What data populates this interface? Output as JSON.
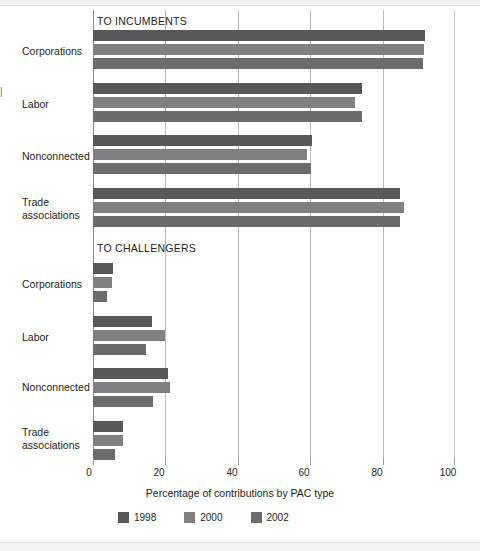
{
  "chart_data": {
    "type": "bar",
    "orientation": "horizontal",
    "title": "",
    "xlabel": "Percentage of contributions by PAC type",
    "ylabel": "",
    "xlim": [
      0,
      100
    ],
    "xticks": [
      0,
      20,
      40,
      60,
      80,
      100
    ],
    "xtick_labels": [
      "0",
      "20",
      "40",
      "60",
      "80",
      "100"
    ],
    "grid": true,
    "legend_position": "bottom",
    "legend": [
      "1998",
      "2000",
      "2002"
    ],
    "series_colors": [
      "#58585a",
      "#808082",
      "#6c6c6e"
    ],
    "panels": [
      {
        "label": "TO INCUMBENTS",
        "categories": [
          "Corporations",
          "Labor",
          "Nonconnected",
          "Trade\nassociations"
        ],
        "series": [
          {
            "name": "1998",
            "values": [
              91.7,
              74.3,
              60.5,
              84.8
            ]
          },
          {
            "name": "2000",
            "values": [
              91.4,
              72.4,
              59.1,
              85.9
            ]
          },
          {
            "name": "2002",
            "values": [
              91.2,
              74.3,
              60.2,
              84.8
            ]
          }
        ]
      },
      {
        "label": "TO CHALLENGERS",
        "categories": [
          "Corporations",
          "Labor",
          "Nonconnected",
          "Trade\nassociations"
        ],
        "series": [
          {
            "name": "1998",
            "values": [
              5.5,
              16.3,
              20.7,
              8.3
            ]
          },
          {
            "name": "2000",
            "values": [
              5.2,
              19.9,
              21.3,
              8.3
            ]
          },
          {
            "name": "2002",
            "values": [
              3.9,
              14.6,
              16.6,
              6.1
            ]
          }
        ]
      }
    ]
  },
  "axis": {
    "x_title": "Percentage of contributions by PAC type"
  },
  "legend": {
    "items": [
      {
        "label": "1998",
        "color": "#58585a"
      },
      {
        "label": "2000",
        "color": "#808082"
      },
      {
        "label": "2002",
        "color": "#6c6c6e"
      }
    ]
  },
  "headings": {
    "incumbents": "TO INCUMBENTS",
    "challengers": "TO CHALLENGERS"
  },
  "categories": {
    "corporations": "Corporations",
    "labor": "Labor",
    "nonconnected": "Nonconnected",
    "trade_associations": "Trade\nassociations"
  },
  "ticks": {
    "t0": "0",
    "t20": "20",
    "t40": "40",
    "t60": "60",
    "t80": "80",
    "t100": "100"
  }
}
